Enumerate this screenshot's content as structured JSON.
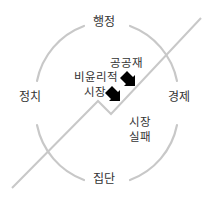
{
  "diagram": {
    "colors": {
      "line": "#c8c8c8",
      "text": "#333333",
      "arrow": "#000000",
      "background": "#ffffff"
    },
    "circle_labels": {
      "top": "행정",
      "left": "정치",
      "right": "경제",
      "bottom": "집단"
    },
    "inner_labels": {
      "public_goods": "공공재",
      "unethical_market_line1": "비윤리적",
      "unethical_market_line2": "시장",
      "market_failure_line1": "시장",
      "market_failure_line2": "실패"
    },
    "icons": [
      "arrow-down-right-icon",
      "arrow-down-right-icon"
    ]
  }
}
